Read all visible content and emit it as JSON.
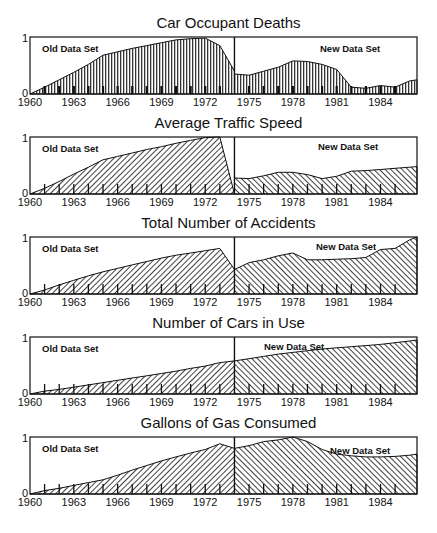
{
  "chart_data": [
    {
      "type": "area",
      "title": "Car Occupant Deaths",
      "xlabel": "",
      "ylabel": "",
      "ylim": [
        0,
        1
      ],
      "xlim": [
        1960,
        1986.5
      ],
      "yticks": [
        "0",
        "1"
      ],
      "xticks": [
        "1960",
        "1963",
        "1966",
        "1969",
        "1972",
        "1975",
        "1978",
        "1981",
        "1984"
      ],
      "divider_year": 1974,
      "annotations": [
        "Old Data Set",
        "New Data Set"
      ],
      "fill": "vertical-lines",
      "series": [
        {
          "name": "Old Data Set",
          "x": [
            1960,
            1961,
            1962,
            1963,
            1964,
            1965,
            1966,
            1967,
            1968,
            1969,
            1970,
            1971,
            1972,
            1973,
            1974
          ],
          "values": [
            0.0,
            0.12,
            0.25,
            0.38,
            0.52,
            0.68,
            0.74,
            0.8,
            0.85,
            0.9,
            0.95,
            0.97,
            0.98,
            0.85,
            0.4
          ]
        },
        {
          "name": "New Data Set",
          "x": [
            1974,
            1975,
            1976,
            1977,
            1978,
            1979,
            1980,
            1981,
            1982,
            1983,
            1984,
            1985,
            1986,
            1986.5
          ],
          "values": [
            0.35,
            0.33,
            0.4,
            0.47,
            0.58,
            0.57,
            0.52,
            0.43,
            0.12,
            0.1,
            0.15,
            0.12,
            0.23,
            0.25
          ]
        }
      ]
    },
    {
      "type": "area",
      "title": "Average Traffic Speed",
      "xlabel": "",
      "ylabel": "",
      "ylim": [
        0,
        1
      ],
      "xlim": [
        1960,
        1986.5
      ],
      "yticks": [
        "0",
        "1"
      ],
      "xticks": [
        "1960",
        "1963",
        "1966",
        "1969",
        "1972",
        "1975",
        "1978",
        "1981",
        "1984"
      ],
      "divider_year": 1974,
      "annotations": [
        "Old Data Set",
        "New Data Set"
      ],
      "fill": "diagonal-hatch",
      "series": [
        {
          "name": "Old Data Set",
          "x": [
            1960,
            1961,
            1962,
            1963,
            1964,
            1965,
            1966,
            1967,
            1968,
            1969,
            1970,
            1971,
            1972,
            1973,
            1974
          ],
          "values": [
            0.0,
            0.1,
            0.22,
            0.35,
            0.47,
            0.6,
            0.66,
            0.72,
            0.78,
            0.83,
            0.89,
            0.94,
            0.99,
            1.0,
            0.0
          ]
        },
        {
          "name": "New Data Set",
          "x": [
            1974,
            1975,
            1976,
            1977,
            1978,
            1979,
            1980,
            1981,
            1982,
            1983,
            1984,
            1985,
            1986,
            1986.5
          ],
          "values": [
            0.28,
            0.27,
            0.32,
            0.38,
            0.38,
            0.34,
            0.27,
            0.31,
            0.4,
            0.41,
            0.43,
            0.45,
            0.47,
            0.48
          ]
        }
      ]
    },
    {
      "type": "area",
      "title": "Total Number of Accidents",
      "xlabel": "",
      "ylabel": "",
      "ylim": [
        0,
        1
      ],
      "xlim": [
        1960,
        1986.5
      ],
      "yticks": [
        "0",
        "1"
      ],
      "xticks": [
        "1960",
        "1963",
        "1966",
        "1969",
        "1972",
        "1975",
        "1978",
        "1981",
        "1984"
      ],
      "divider_year": 1974,
      "annotations": [
        "Old Data Set",
        "New Data Set"
      ],
      "fill": "diagonal-hatch",
      "series": [
        {
          "name": "Old Data Set",
          "x": [
            1960,
            1961,
            1962,
            1963,
            1964,
            1965,
            1966,
            1967,
            1968,
            1969,
            1970,
            1971,
            1972,
            1973,
            1974
          ],
          "values": [
            0.0,
            0.07,
            0.16,
            0.24,
            0.32,
            0.39,
            0.45,
            0.51,
            0.57,
            0.63,
            0.68,
            0.72,
            0.76,
            0.8,
            0.43
          ]
        },
        {
          "name": "New Data Set",
          "x": [
            1974,
            1975,
            1976,
            1977,
            1978,
            1979,
            1980,
            1981,
            1982,
            1983,
            1984,
            1985,
            1986,
            1986.5
          ],
          "values": [
            0.43,
            0.55,
            0.6,
            0.67,
            0.72,
            0.6,
            0.6,
            0.61,
            0.62,
            0.64,
            0.78,
            0.8,
            0.95,
            1.0
          ]
        }
      ]
    },
    {
      "type": "area",
      "title": "Number of Cars in Use",
      "xlabel": "",
      "ylabel": "",
      "ylim": [
        0,
        1
      ],
      "xlim": [
        1960,
        1986.5
      ],
      "yticks": [
        "0",
        "1"
      ],
      "xticks": [
        "1960",
        "1963",
        "1966",
        "1969",
        "1972",
        "1975",
        "1978",
        "1981",
        "1984"
      ],
      "divider_year": 1974,
      "annotations": [
        "Old Data Set",
        "New Data Set"
      ],
      "fill": "diagonal-hatch",
      "series": [
        {
          "name": "Old Data Set",
          "x": [
            1960,
            1961,
            1962,
            1963,
            1964,
            1965,
            1966,
            1967,
            1968,
            1969,
            1970,
            1971,
            1972,
            1973,
            1974
          ],
          "values": [
            0.0,
            0.05,
            0.08,
            0.12,
            0.16,
            0.2,
            0.24,
            0.28,
            0.32,
            0.36,
            0.4,
            0.45,
            0.49,
            0.55,
            0.58
          ]
        },
        {
          "name": "New Data Set",
          "x": [
            1974,
            1975,
            1976,
            1977,
            1978,
            1979,
            1980,
            1981,
            1982,
            1983,
            1984,
            1985,
            1986,
            1986.5
          ],
          "values": [
            0.58,
            0.62,
            0.66,
            0.7,
            0.73,
            0.76,
            0.79,
            0.81,
            0.83,
            0.85,
            0.87,
            0.9,
            0.93,
            0.95
          ]
        }
      ]
    },
    {
      "type": "area",
      "title": "Gallons of Gas Consumed",
      "xlabel": "",
      "ylabel": "",
      "ylim": [
        0,
        1
      ],
      "xlim": [
        1960,
        1986.5
      ],
      "yticks": [
        "0",
        "1"
      ],
      "xticks": [
        "1960",
        "1963",
        "1966",
        "1969",
        "1972",
        "1975",
        "1978",
        "1981",
        "1984"
      ],
      "divider_year": 1974,
      "annotations": [
        "Old Data Set",
        "New Data Set"
      ],
      "fill": "diagonal-hatch",
      "series": [
        {
          "name": "Old Data Set",
          "x": [
            1960,
            1961,
            1962,
            1963,
            1964,
            1965,
            1966,
            1967,
            1968,
            1969,
            1970,
            1971,
            1972,
            1973,
            1974
          ],
          "values": [
            0.0,
            0.06,
            0.1,
            0.15,
            0.2,
            0.25,
            0.33,
            0.42,
            0.5,
            0.58,
            0.65,
            0.72,
            0.78,
            0.88,
            0.8
          ]
        },
        {
          "name": "New Data Set",
          "x": [
            1974,
            1975,
            1976,
            1977,
            1978,
            1979,
            1980,
            1981,
            1982,
            1983,
            1984,
            1985,
            1986,
            1986.5
          ],
          "values": [
            0.8,
            0.85,
            0.92,
            0.95,
            1.0,
            0.92,
            0.78,
            0.7,
            0.67,
            0.65,
            0.65,
            0.66,
            0.68,
            0.7
          ]
        }
      ]
    }
  ],
  "labels": {
    "old": "Old Data Set",
    "new": "New Data Set"
  }
}
